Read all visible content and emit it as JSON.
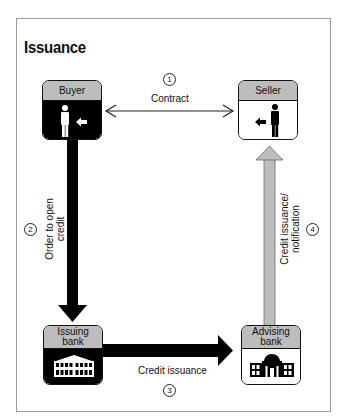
{
  "title": "Issuance",
  "nodes": {
    "buyer": {
      "label": "Buyer",
      "style": "dark",
      "icon": "person-icon"
    },
    "seller": {
      "label": "Seller",
      "style": "light",
      "icon": "person-icon"
    },
    "issuing_bank": {
      "label_line1": "Issuing",
      "label_line2": "bank",
      "style": "dark",
      "icon": "bank-building-icon"
    },
    "advising_bank": {
      "label_line1": "Advising",
      "label_line2": "bank",
      "style": "light",
      "icon": "domed-bank-building-icon"
    }
  },
  "steps": [
    {
      "number": "1",
      "label": "Contract",
      "from": "buyer",
      "to": "seller",
      "arrow": "double-thin"
    },
    {
      "number": "2",
      "label_line1": "Order to open",
      "label_line2": "credit",
      "from": "buyer",
      "to": "issuing_bank",
      "arrow": "thick-black"
    },
    {
      "number": "3",
      "label": "Credit issuance",
      "from": "issuing_bank",
      "to": "advising_bank",
      "arrow": "thick-black"
    },
    {
      "number": "4",
      "label_line1": "Credit issuance/",
      "label_line2": "notification",
      "from": "advising_bank",
      "to": "seller",
      "arrow": "thick-gray"
    }
  ],
  "colors": {
    "header_gray": "#bdbdbd",
    "dark_fill": "#000000",
    "gray_arrow": "#b8b8b8",
    "frame_border": "#9a9a9a"
  }
}
